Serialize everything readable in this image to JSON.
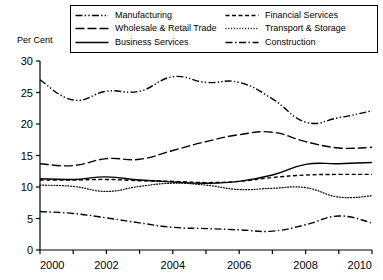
{
  "axis_title": "Per Cent",
  "legend": {
    "items": [
      {
        "label": "Manufacturing",
        "key": "dash-dot-dot-line",
        "col": 0,
        "row": 0
      },
      {
        "label": "Wholesale & Retail Trade",
        "key": "long-dash-line",
        "col": 0,
        "row": 1
      },
      {
        "label": "Business Services",
        "key": "solid-line",
        "col": 0,
        "row": 2
      },
      {
        "label": "Financial Services",
        "key": "dashed-line",
        "col": 1,
        "row": 0
      },
      {
        "label": "Transport & Storage",
        "key": "dotted-line",
        "col": 1,
        "row": 1
      },
      {
        "label": "Construction",
        "key": "dash-dot-line",
        "col": 1,
        "row": 2
      }
    ]
  },
  "chart_data": {
    "type": "line",
    "title": "",
    "xlabel": "",
    "ylabel": "Per Cent",
    "xlim": [
      2000,
      2010
    ],
    "ylim": [
      0,
      30
    ],
    "ytick_step": 5,
    "yticks": [
      0,
      5,
      10,
      15,
      20,
      25,
      30
    ],
    "xticks": [
      2000,
      2002,
      2004,
      2006,
      2008,
      2010
    ],
    "xticks_minor": [
      2001,
      2003,
      2005,
      2007,
      2009
    ],
    "grid": false,
    "legend_position": "top",
    "x": [
      2000,
      2001,
      2002,
      2003,
      2004,
      2005,
      2006,
      2007,
      2008,
      2009,
      2010
    ],
    "series": [
      {
        "name": "Manufacturing",
        "style": "dash-dot-dot",
        "values": [
          27.0,
          23.8,
          25.2,
          25.2,
          27.5,
          26.6,
          26.6,
          24.0,
          20.3,
          21.0,
          22.1
        ]
      },
      {
        "name": "Wholesale & Retail Trade",
        "style": "long-dash",
        "values": [
          13.7,
          13.4,
          14.5,
          14.4,
          15.8,
          17.2,
          18.3,
          18.7,
          17.2,
          16.2,
          16.3
        ]
      },
      {
        "name": "Business Services",
        "style": "solid",
        "values": [
          11.3,
          11.2,
          11.6,
          11.1,
          10.8,
          10.6,
          10.9,
          11.9,
          13.6,
          13.7,
          13.9
        ]
      },
      {
        "name": "Financial Services",
        "style": "dashed",
        "values": [
          11.1,
          11.1,
          11.2,
          11.0,
          10.9,
          10.7,
          10.9,
          11.5,
          11.9,
          12.0,
          12.0
        ]
      },
      {
        "name": "Transport & Storage",
        "style": "dotted",
        "values": [
          10.3,
          10.1,
          9.3,
          10.1,
          10.6,
          10.3,
          9.6,
          9.8,
          9.9,
          8.4,
          8.6
        ]
      },
      {
        "name": "Construction",
        "style": "dash-dot",
        "values": [
          6.1,
          5.8,
          5.1,
          4.3,
          3.6,
          3.4,
          3.2,
          3.0,
          4.0,
          5.4,
          4.3
        ]
      }
    ]
  }
}
